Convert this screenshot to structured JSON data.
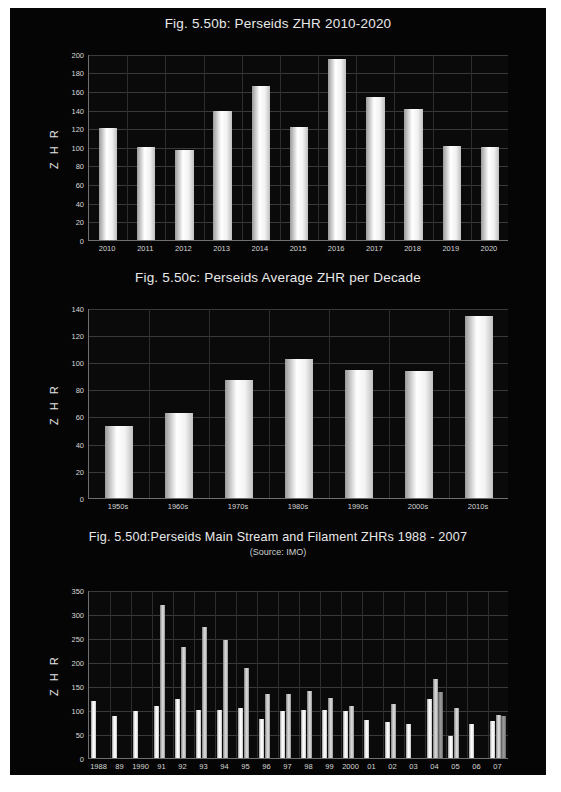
{
  "page": {
    "background": "#050505",
    "paper": "#ffffff"
  },
  "figures": [
    {
      "id": "fig-b",
      "title": "Fig. 5.50b: Perseids ZHR 2010-2020",
      "subtitle": "",
      "ylabel": "Z H R"
    },
    {
      "id": "fig-c",
      "title": "Fig. 5.50c: Perseids Average ZHR per Decade",
      "subtitle": "",
      "ylabel": "Z H R"
    },
    {
      "id": "fig-d",
      "title": "Fig. 5.50d:Perseids Main Stream and Filament ZHRs 1988 - 2007",
      "subtitle": "(Source: IMO)",
      "ylabel": "Z H R"
    }
  ],
  "chart_data": [
    {
      "type": "bar",
      "title": "Fig. 5.50b: Perseids ZHR 2010-2020",
      "xlabel": "",
      "ylabel": "Z H R",
      "ylim": [
        0,
        200
      ],
      "yticks": [
        0,
        20,
        40,
        60,
        80,
        100,
        120,
        140,
        160,
        180,
        200
      ],
      "grid": true,
      "legend": false,
      "categories": [
        "2010",
        "2011",
        "2012",
        "2013",
        "2014",
        "2015",
        "2016",
        "2017",
        "2018",
        "2019",
        "2020"
      ],
      "values": [
        120,
        100,
        97,
        139,
        165,
        121,
        195,
        154,
        141,
        101,
        100
      ]
    },
    {
      "type": "bar",
      "title": "Fig. 5.50c: Perseids Average ZHR per Decade",
      "xlabel": "",
      "ylabel": "Z H R",
      "ylim": [
        0,
        140
      ],
      "yticks": [
        0,
        20,
        40,
        60,
        80,
        100,
        120,
        140
      ],
      "grid": true,
      "legend": false,
      "categories": [
        "1950s",
        "1960s",
        "1970s",
        "1980s",
        "1990s",
        "2000s",
        "2010s"
      ],
      "values": [
        53,
        62.5,
        87,
        102,
        94,
        93.5,
        134
      ]
    },
    {
      "type": "bar",
      "title": "Fig. 5.50d:Perseids Main Stream and Filament ZHRs 1988 - 2007",
      "subtitle": "(Source: IMO)",
      "xlabel": "",
      "ylabel": "Z H R",
      "ylim": [
        0,
        350
      ],
      "yticks": [
        0,
        50,
        100,
        150,
        200,
        250,
        300,
        350
      ],
      "grid": true,
      "legend": true,
      "legend_position": "bottom",
      "categories": [
        "1988",
        "89",
        "1990",
        "91",
        "92",
        "93",
        "94",
        "95",
        "96",
        "97",
        "98",
        "99",
        "2000",
        "01",
        "02",
        "03",
        "04",
        "05",
        "06",
        "07"
      ],
      "series": [
        {
          "name": "Main Stream",
          "values": [
            118,
            88,
            97,
            108,
            122,
            100,
            100,
            103,
            80,
            98,
            100,
            100,
            97,
            78,
            75,
            71,
            122,
            45,
            70,
            76
          ]
        },
        {
          "name": "Filament 1",
          "values": [
            0,
            0,
            0,
            318,
            230,
            273,
            245,
            186,
            133,
            132,
            140,
            124,
            107,
            0,
            113,
            0,
            165,
            103,
            0,
            90
          ]
        },
        {
          "name": "Filament 2",
          "values": [
            0,
            0,
            0,
            0,
            0,
            0,
            0,
            0,
            0,
            0,
            0,
            0,
            0,
            0,
            0,
            0,
            138,
            0,
            0,
            88
          ]
        }
      ]
    }
  ],
  "legend": {
    "items": [
      "Main Stream",
      "Filament 1",
      "Filament 2"
    ]
  }
}
